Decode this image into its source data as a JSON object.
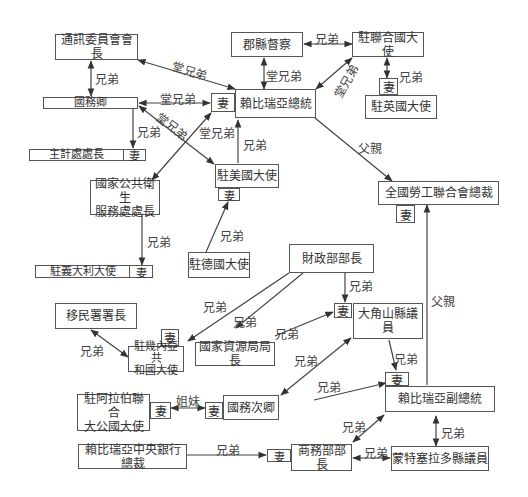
{
  "diagram": {
    "nodes": {
      "tongxun": "通訊委員會會長",
      "junxian": "郡縣督察",
      "lianheguo": "駐聯合國大使",
      "yingguo": "駐英國大使",
      "guowuqing": "國務卿",
      "zongtong": "賴比瑞亞總統",
      "zhuji": "主計處處長",
      "meiguo": "駐美國大使",
      "laogong": "全國勞工聯合會總裁",
      "weisheng": "國家公共衛生\n服務處處長",
      "yidali": "駐義大利大使",
      "deguo": "駐德國大使",
      "caizheng": "財政部部長",
      "yimin": "移民署署長",
      "jineiya": "駐幾內亞共\n和國大使",
      "ziyuan": "國家資源局局長",
      "dajiaoshan": "大角山縣議員",
      "alabo": "駐阿拉伯聯合\n大公國大使",
      "guowucilang": "國務次卿",
      "fuzongtong": "賴比瑞亞副總統",
      "yinhang": "賴比瑞亞中央銀行總裁",
      "shangwu": "商務部部長",
      "mengte": "蒙特塞拉多縣議員"
    },
    "wife_label": "妻",
    "edge_labels": {
      "brothers": "兄弟",
      "cousins": "堂兄弟",
      "father": "父親",
      "sisters": "姐妹"
    }
  }
}
